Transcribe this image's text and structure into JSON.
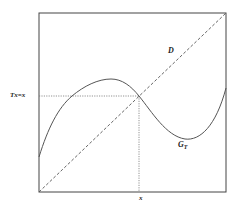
{
  "figure": {
    "labels": {
      "fixed_point_value": "Tx=x",
      "diagonal": "D",
      "graph_main": "G",
      "graph_sub": "T",
      "x_axis_point": "x"
    },
    "colors": {
      "frame": "#444444",
      "curve": "#555555",
      "diagonal": "#555555",
      "guide": "#777777",
      "text": "#222222",
      "background": "#ffffff"
    },
    "frame": {
      "x": 39,
      "y": 13,
      "width": 187,
      "height": 179
    },
    "fixed_point": {
      "x": 139,
      "y": 96
    },
    "curve_points": [
      [
        39,
        157
      ],
      [
        50,
        127
      ],
      [
        60,
        110
      ],
      [
        72,
        96
      ],
      [
        85,
        86
      ],
      [
        98,
        81
      ],
      [
        111,
        79
      ],
      [
        122,
        81
      ],
      [
        132,
        88
      ],
      [
        139,
        96
      ],
      [
        150,
        110
      ],
      [
        162,
        125
      ],
      [
        175,
        136
      ],
      [
        185,
        139
      ],
      [
        196,
        137
      ],
      [
        206,
        130
      ],
      [
        215,
        115
      ],
      [
        222,
        100
      ],
      [
        226,
        88
      ]
    ]
  }
}
